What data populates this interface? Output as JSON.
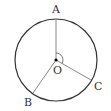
{
  "diagram": {
    "type": "circle-geometry",
    "circle": {
      "center": "O",
      "cx": 56,
      "cy": 60,
      "r": 41,
      "stroke": "#333333"
    },
    "points": [
      {
        "name": "A",
        "x": 56,
        "y": 19,
        "label": "A",
        "lx": 52,
        "ly": 4
      },
      {
        "name": "B",
        "x": 33,
        "y": 93,
        "label": "B",
        "lx": 24,
        "ly": 97
      },
      {
        "name": "C",
        "x": 91,
        "y": 80,
        "label": "C",
        "lx": 94,
        "ly": 81
      },
      {
        "name": "O",
        "x": 56,
        "y": 60,
        "label": "O",
        "lx": 53,
        "ly": 65
      }
    ],
    "segments": [
      "OA",
      "OB",
      "OC"
    ],
    "angle_mark": {
      "between": [
        "OA",
        "OC"
      ],
      "color": "#555555"
    },
    "segment_color": "#888888"
  }
}
